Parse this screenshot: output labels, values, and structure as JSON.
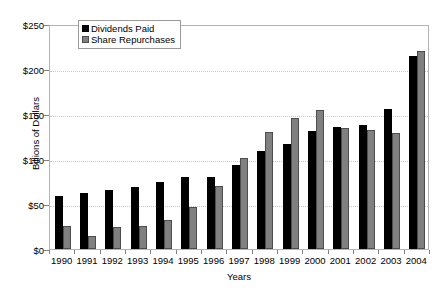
{
  "chart_data": {
    "type": "bar",
    "title": "",
    "xlabel": "Years",
    "ylabel": "Billions of Dollars",
    "ylim": [
      0,
      250
    ],
    "ytick_values": [
      0,
      50,
      100,
      150,
      200,
      250
    ],
    "ytick_labels": [
      "$0",
      "$50",
      "$100",
      "$150",
      "$200",
      "$250"
    ],
    "grid": true,
    "legend_position": "top-left-inside",
    "categories": [
      "1990",
      "1991",
      "1992",
      "1993",
      "1994",
      "1995",
      "1996",
      "1997",
      "1998",
      "1999",
      "2000",
      "2001",
      "2002",
      "2003",
      "2004"
    ],
    "series": [
      {
        "name": "Dividends Paid",
        "color": "#000000",
        "values": [
          59,
          62,
          66,
          69,
          74,
          80,
          80,
          93,
          109,
          117,
          131,
          136,
          138,
          156,
          215
        ]
      },
      {
        "name": "Share Repurchases",
        "color": "#808080",
        "values": [
          26,
          15,
          24,
          26,
          32,
          47,
          70,
          101,
          130,
          146,
          155,
          134,
          132,
          129,
          220
        ]
      }
    ]
  },
  "legend": {
    "items": [
      {
        "label": "Dividends Paid"
      },
      {
        "label": "Share Repurchases"
      }
    ]
  }
}
